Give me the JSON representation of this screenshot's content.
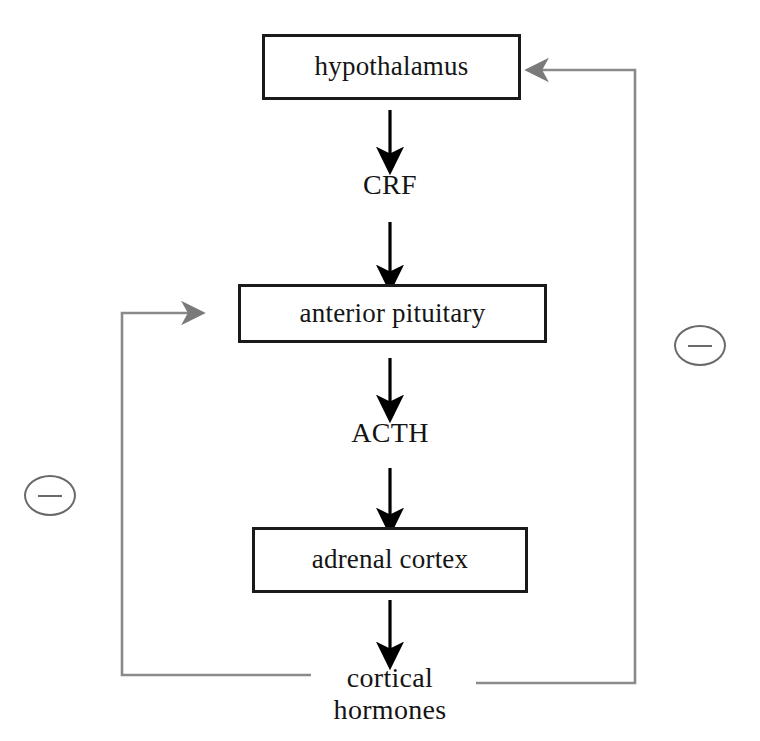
{
  "diagram": {
    "nodes": [
      {
        "id": "hypothalamus",
        "label": "hypothalamus"
      },
      {
        "id": "anterior_pituitary",
        "label": "anterior pituitary"
      },
      {
        "id": "adrenal_cortex",
        "label": "adrenal cortex"
      }
    ],
    "hormones": [
      {
        "id": "crf",
        "label": "CRF"
      },
      {
        "id": "acth",
        "label": "ACTH"
      },
      {
        "id": "cortical_hormones",
        "line1": "cortical",
        "line2": "hormones"
      }
    ],
    "feedback": [
      {
        "id": "minus_left",
        "symbol": "−",
        "target": "anterior pituitary"
      },
      {
        "id": "minus_right",
        "symbol": "−",
        "target": "hypothalamus"
      }
    ],
    "colors": {
      "box_border": "#1a1a1a",
      "text": "#141414",
      "stimulatory_arrow": "#000000",
      "feedback_arrow": "#6a6a6a",
      "background": "#ffffff"
    }
  }
}
